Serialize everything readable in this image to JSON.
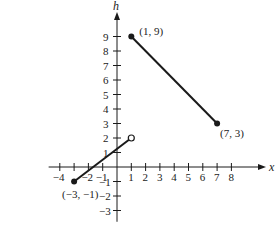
{
  "chart_data": {
    "type": "line",
    "title": "",
    "xlabel": "x",
    "ylabel": "h",
    "xlim": [
      -4.5,
      9.5
    ],
    "ylim": [
      -3.5,
      10
    ],
    "grid": false,
    "x_ticks": [
      -4,
      -3,
      -2,
      -1,
      1,
      2,
      3,
      4,
      5,
      6,
      7,
      8
    ],
    "x_tick_labels": [
      "-4",
      "",
      "-2",
      "-1",
      "1",
      "2",
      "3",
      "4",
      "5",
      "6",
      "7",
      "8"
    ],
    "y_ticks": [
      -3,
      -2,
      -1,
      1,
      2,
      3,
      4,
      5,
      6,
      7,
      8,
      9
    ],
    "y_tick_labels": [
      "-3",
      "-2",
      "-1",
      "1",
      "2",
      "3",
      "4",
      "5",
      "6",
      "7",
      "8",
      "9"
    ],
    "series": [
      {
        "name": "segment-1",
        "x": [
          -3,
          1
        ],
        "y": [
          -1,
          2
        ],
        "endpoints": [
          "closed",
          "open"
        ]
      },
      {
        "name": "segment-2",
        "x": [
          1,
          7
        ],
        "y": [
          9,
          3
        ],
        "endpoints": [
          "closed",
          "closed"
        ]
      }
    ],
    "annotations": [
      {
        "text": "(1, 9)",
        "x": 1,
        "y": 9
      },
      {
        "text": "(7, 3)",
        "x": 7,
        "y": 3
      },
      {
        "text": "(-3, -1)",
        "x": -3,
        "y": -1
      }
    ]
  },
  "layout": {
    "origin_px": [
      117,
      167
    ],
    "unit_x_px": 14.3,
    "unit_y_px": 14.5,
    "line_color": "#1a1a1a"
  }
}
